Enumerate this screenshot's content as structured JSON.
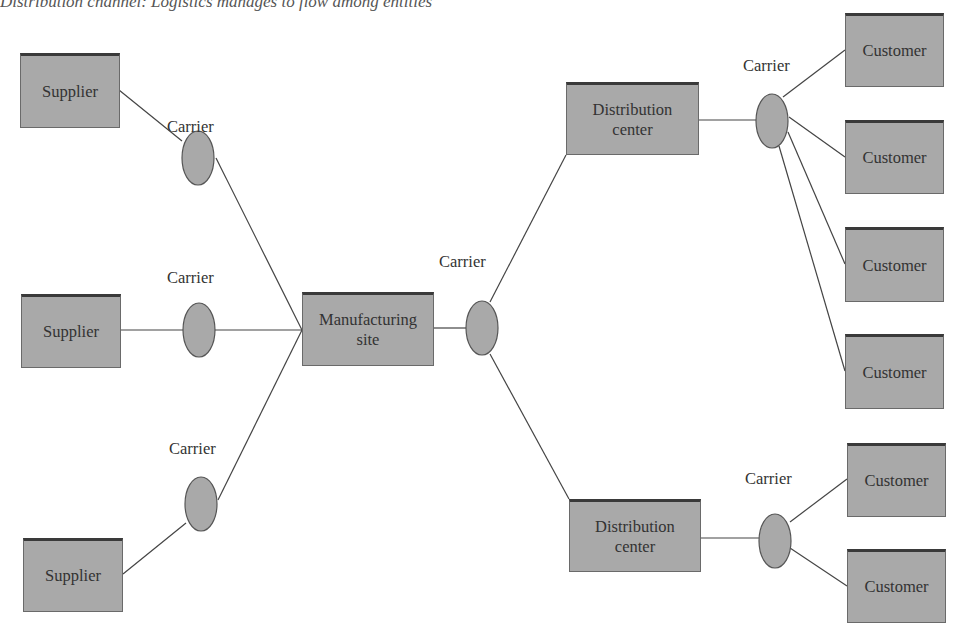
{
  "caption": "Distribution channel: Logistics manages to flow among entities",
  "nodes": {
    "supplier_1": "Supplier",
    "supplier_2": "Supplier",
    "supplier_3": "Supplier",
    "manufacturing_site": "Manufacturing site",
    "distribution_center_1": "Distribution center",
    "distribution_center_2": "Distribution center",
    "customer_1": "Customer",
    "customer_2": "Customer",
    "customer_3": "Customer",
    "customer_4": "Customer",
    "customer_5": "Customer",
    "customer_6": "Customer"
  },
  "carriers": {
    "carrier_1": "Carrier",
    "carrier_2": "Carrier",
    "carrier_3": "Carrier",
    "carrier_mfg": "Carrier",
    "carrier_dc1": "Carrier",
    "carrier_dc2": "Carrier"
  },
  "colors": {
    "box_fill": "#a9a9a9",
    "ellipse_fill": "#a9a9a9",
    "line": "#444444"
  }
}
